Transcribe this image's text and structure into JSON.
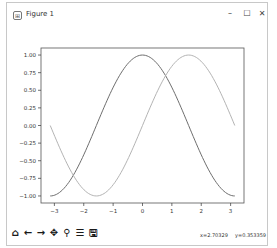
{
  "window": {
    "title": "Figure 1",
    "controls": {
      "minimize": "–",
      "maximize": "☐",
      "close": "✕"
    }
  },
  "toolbar": {
    "buttons": [
      {
        "name": "home",
        "glyph": "⌂"
      },
      {
        "name": "back",
        "glyph": "←"
      },
      {
        "name": "forward",
        "glyph": "→"
      },
      {
        "name": "pan",
        "glyph": "✥"
      },
      {
        "name": "zoom",
        "glyph": "⚲"
      },
      {
        "name": "configure-subplots",
        "glyph": "☰"
      },
      {
        "name": "save",
        "glyph": "🖫"
      }
    ]
  },
  "status": {
    "x": "x=2.70329",
    "y": "y=0.353359"
  },
  "colors": {
    "cos_line": "#6e6e6e",
    "sin_line": "#b4b4b4",
    "axes": "#555555"
  },
  "chart_data": {
    "type": "line",
    "title": "",
    "xlabel": "",
    "ylabel": "",
    "xlim": [
      -3.4557,
      3.4557
    ],
    "ylim": [
      -1.1,
      1.1
    ],
    "grid": false,
    "legend": null,
    "xticks": [
      -3,
      -2,
      -1,
      0,
      1,
      2,
      3
    ],
    "xtick_labels": [
      "−3",
      "−2",
      "−1",
      "0",
      "1",
      "2",
      "3"
    ],
    "yticks": [
      1.0,
      0.75,
      0.5,
      0.25,
      0.0,
      -0.25,
      -0.5,
      -0.75,
      -1.0
    ],
    "ytick_labels": [
      "1.00",
      "0.75",
      "0.50",
      "0.25",
      "0.00",
      "−0.25",
      "−0.50",
      "−0.75",
      "−1.00"
    ],
    "x": [
      -3.1416,
      -2.7489,
      -2.3562,
      -1.9635,
      -1.5708,
      -1.1781,
      -0.7854,
      -0.3927,
      0.0,
      0.3927,
      0.7854,
      1.1781,
      1.5708,
      1.9635,
      2.3562,
      2.7489,
      3.1416
    ],
    "series": [
      {
        "name": "cos(x)",
        "values": [
          -1.0,
          -0.924,
          -0.707,
          -0.383,
          0.0,
          0.383,
          0.707,
          0.924,
          1.0,
          0.924,
          0.707,
          0.383,
          0.0,
          -0.383,
          -0.707,
          -0.924,
          -1.0
        ]
      },
      {
        "name": "sin(x)",
        "values": [
          0.0,
          -0.383,
          -0.707,
          -0.924,
          -1.0,
          -0.924,
          -0.707,
          -0.383,
          0.0,
          0.383,
          0.707,
          0.924,
          1.0,
          0.924,
          0.707,
          0.383,
          0.0
        ]
      }
    ]
  }
}
